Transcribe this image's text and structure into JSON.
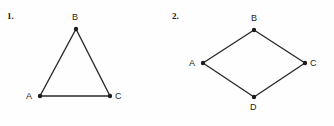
{
  "page": {
    "background_color": "#fefefe",
    "ink_color": "#1c1c1c",
    "line_color": "#2b2b2b"
  },
  "figures": [
    {
      "number": "1.",
      "shape": "triangle",
      "vertices": [
        {
          "label": "A",
          "x": 40,
          "y": 96,
          "label_x": 26,
          "label_y": 92
        },
        {
          "label": "B",
          "x": 76,
          "y": 29,
          "label_x": 72,
          "label_y": 13
        },
        {
          "label": "C",
          "x": 110,
          "y": 96,
          "label_x": 115,
          "label_y": 92
        }
      ],
      "edges": [
        {
          "from": "A",
          "to": "B"
        },
        {
          "from": "B",
          "to": "C"
        },
        {
          "from": "C",
          "to": "A"
        }
      ]
    },
    {
      "number": "2.",
      "shape": "quadrilateral",
      "vertices": [
        {
          "label": "A",
          "x": 36,
          "y": 63,
          "label_x": 22,
          "label_y": 59
        },
        {
          "label": "B",
          "x": 87,
          "y": 30,
          "label_x": 84,
          "label_y": 14
        },
        {
          "label": "C",
          "x": 138,
          "y": 63,
          "label_x": 143,
          "label_y": 59
        },
        {
          "label": "D",
          "x": 87,
          "y": 97,
          "label_x": 83,
          "label_y": 103
        }
      ],
      "edges": [
        {
          "from": "A",
          "to": "B"
        },
        {
          "from": "B",
          "to": "C"
        },
        {
          "from": "C",
          "to": "D"
        },
        {
          "from": "D",
          "to": "A"
        }
      ]
    }
  ]
}
